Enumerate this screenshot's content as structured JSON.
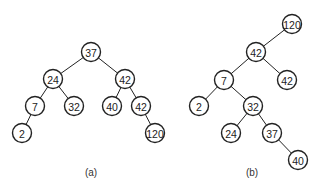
{
  "trees": [
    {
      "id": "a",
      "caption": "(a)",
      "caption_pos": [
        91,
        176
      ],
      "nodes": [
        {
          "id": "a0",
          "label": "37",
          "x": 91,
          "y": 52
        },
        {
          "id": "a1",
          "label": "24",
          "x": 53,
          "y": 79
        },
        {
          "id": "a2",
          "label": "42",
          "x": 125,
          "y": 79
        },
        {
          "id": "a3",
          "label": "7",
          "x": 35,
          "y": 106
        },
        {
          "id": "a4",
          "label": "32",
          "x": 74,
          "y": 106
        },
        {
          "id": "a5",
          "label": "40",
          "x": 112,
          "y": 106
        },
        {
          "id": "a6",
          "label": "42",
          "x": 141,
          "y": 106
        },
        {
          "id": "a7",
          "label": "2",
          "x": 22,
          "y": 133
        },
        {
          "id": "a8",
          "label": "120",
          "x": 155,
          "y": 133
        }
      ],
      "edges": [
        [
          "a0",
          "a1"
        ],
        [
          "a0",
          "a2"
        ],
        [
          "a1",
          "a3"
        ],
        [
          "a1",
          "a4"
        ],
        [
          "a2",
          "a5"
        ],
        [
          "a2",
          "a6"
        ],
        [
          "a3",
          "a7"
        ],
        [
          "a6",
          "a8"
        ]
      ]
    },
    {
      "id": "b",
      "caption": "(b)",
      "caption_pos": [
        252,
        176
      ],
      "nodes": [
        {
          "id": "b0",
          "label": "120",
          "x": 292,
          "y": 24
        },
        {
          "id": "b1",
          "label": "42",
          "x": 256,
          "y": 52
        },
        {
          "id": "b2",
          "label": "7",
          "x": 224,
          "y": 80
        },
        {
          "id": "b3",
          "label": "42",
          "x": 287,
          "y": 80
        },
        {
          "id": "b4",
          "label": "2",
          "x": 199,
          "y": 106
        },
        {
          "id": "b5",
          "label": "32",
          "x": 253,
          "y": 106
        },
        {
          "id": "b6",
          "label": "24",
          "x": 231,
          "y": 133
        },
        {
          "id": "b7",
          "label": "37",
          "x": 272,
          "y": 133
        },
        {
          "id": "b8",
          "label": "40",
          "x": 298,
          "y": 160
        }
      ],
      "edges": [
        [
          "b0",
          "b1"
        ],
        [
          "b1",
          "b2"
        ],
        [
          "b1",
          "b3"
        ],
        [
          "b2",
          "b4"
        ],
        [
          "b2",
          "b5"
        ],
        [
          "b5",
          "b6"
        ],
        [
          "b5",
          "b7"
        ],
        [
          "b7",
          "b8"
        ]
      ]
    }
  ],
  "node_radius": 9.5
}
